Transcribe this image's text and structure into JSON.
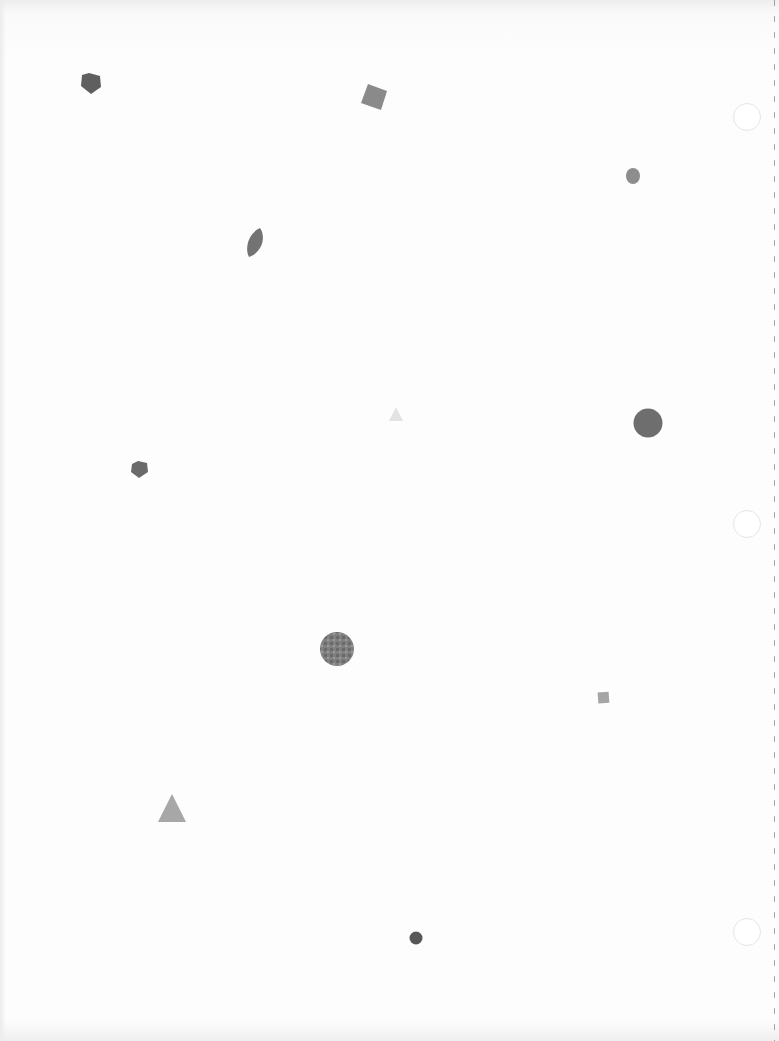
{
  "page": {
    "type": "scanned blank sheet with scattered geometric shapes",
    "background": "#fdfdfd",
    "bleed_text": ""
  },
  "shapes": [
    {
      "kind": "pentagon",
      "x": 80,
      "y": 73,
      "size": 22,
      "color": "#5f5f5f"
    },
    {
      "kind": "square-rotated",
      "x": 363,
      "y": 85,
      "size": 22,
      "rotation": 20,
      "color": "#8a8a8a"
    },
    {
      "kind": "circle",
      "x": 625,
      "y": 168,
      "size": 15,
      "color": "#8d8d8d"
    },
    {
      "kind": "leaf",
      "x": 245,
      "y": 229,
      "size": 20,
      "color": "#737373"
    },
    {
      "kind": "triangle",
      "x": 388,
      "y": 407,
      "size": 14,
      "color": "#e3e3e3"
    },
    {
      "kind": "circle",
      "x": 634,
      "y": 409,
      "size": 28,
      "color": "#6e6e6e"
    },
    {
      "kind": "pentagon",
      "x": 131,
      "y": 461,
      "size": 17,
      "color": "#6a6a6a"
    },
    {
      "kind": "textured-circle",
      "x": 320,
      "y": 632,
      "size": 33,
      "color": "#7f7f7f"
    },
    {
      "kind": "square",
      "x": 598,
      "y": 692,
      "size": 12,
      "color": "#a5a5a5"
    },
    {
      "kind": "triangle",
      "x": 158,
      "y": 795,
      "size": 28,
      "color": "#a7a7a7"
    },
    {
      "kind": "circle",
      "x": 409,
      "y": 931,
      "size": 13,
      "color": "#575757"
    }
  ],
  "punch_holes": [
    {
      "x": 733,
      "y": 103
    },
    {
      "x": 733,
      "y": 510
    },
    {
      "x": 733,
      "y": 918
    }
  ]
}
